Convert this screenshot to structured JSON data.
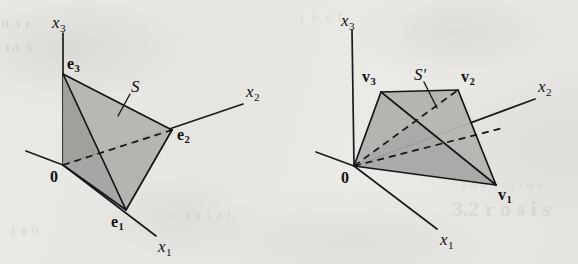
{
  "figure": {
    "background_color": "#e9e8e4",
    "ink_color": "#151515",
    "fill_light": "#b5b4b1",
    "fill_mid": "#a8a7a4",
    "fill_dark": "#9d9c99"
  },
  "ghost_text": {
    "left_top": "0 3 r",
    "left_mid": "to v",
    "left_bottom": "1 0 0",
    "center_bottom": "r a 1 a f",
    "right_heading": "3.2  r  o  s  i  s",
    "right_sub": "s o d u c t i o n",
    "top_right": "c o n t"
  },
  "panels": [
    {
      "id": "left",
      "name": "standard-simplex-panel",
      "set_label": "S",
      "set_label_position": {
        "x": 131,
        "y": 78
      },
      "leader": {
        "x1": 130,
        "y1": 94,
        "x2": 118,
        "y2": 116
      },
      "origin_label": "0",
      "origin_label_position": {
        "x": 50,
        "y": 169
      },
      "origin_point": {
        "x": 63,
        "y": 165
      },
      "axes": [
        {
          "name": "x3",
          "label": "x",
          "subscript": "3",
          "tip": {
            "x": 63,
            "y": 33
          },
          "label_position": {
            "x": 52,
            "y": 14
          }
        },
        {
          "name": "x2",
          "label": "x",
          "subscript": "2",
          "tip": {
            "x": 243,
            "y": 104
          },
          "label_position": {
            "x": 246,
            "y": 83
          }
        },
        {
          "name": "x1",
          "label": "x",
          "subscript": "1",
          "tip": {
            "x": 156,
            "y": 236
          },
          "label_position": {
            "x": 158,
            "y": 238
          }
        },
        {
          "name": "x2-negative",
          "label": "",
          "subscript": "",
          "tip": {
            "x": 26,
            "y": 151
          },
          "label_position": null
        }
      ],
      "vertices": [
        {
          "name": "e3",
          "label": "e",
          "subscript": "3",
          "point": {
            "x": 63,
            "y": 74
          },
          "label_position": {
            "x": 67,
            "y": 56
          }
        },
        {
          "name": "e2",
          "label": "e",
          "subscript": "2",
          "point": {
            "x": 172,
            "y": 130
          },
          "label_position": {
            "x": 177,
            "y": 127
          }
        },
        {
          "name": "e1",
          "label": "e",
          "subscript": "1",
          "point": {
            "x": 126,
            "y": 210
          },
          "label_position": {
            "x": 111,
            "y": 214
          }
        }
      ]
    },
    {
      "id": "right",
      "name": "transformed-simplex-panel",
      "set_label": "S",
      "set_label_prime": "′",
      "set_label_position": {
        "x": 414,
        "y": 66
      },
      "leader": {
        "x1": 424,
        "y1": 82,
        "x2": 437,
        "y2": 108
      },
      "origin_label": "0",
      "origin_label_position": {
        "x": 341,
        "y": 170
      },
      "origin_point": {
        "x": 354,
        "y": 166
      },
      "axes": [
        {
          "name": "x3",
          "label": "x",
          "subscript": "3",
          "tip": {
            "x": 352,
            "y": 30
          },
          "label_position": {
            "x": 341,
            "y": 12
          }
        },
        {
          "name": "x2",
          "label": "x",
          "subscript": "2",
          "tip": {
            "x": 535,
            "y": 99
          },
          "label_position": {
            "x": 538,
            "y": 78
          }
        },
        {
          "name": "x1",
          "label": "x",
          "subscript": "1",
          "tip": {
            "x": 437,
            "y": 229
          },
          "label_position": {
            "x": 440,
            "y": 231
          }
        },
        {
          "name": "x2-negative",
          "label": "",
          "subscript": "",
          "tip": {
            "x": 316,
            "y": 152
          },
          "label_position": null
        }
      ],
      "vertices": [
        {
          "name": "v3",
          "label": "v",
          "subscript": "3",
          "point": {
            "x": 381,
            "y": 92
          },
          "label_position": {
            "x": 362,
            "y": 69
          }
        },
        {
          "name": "v2",
          "label": "v",
          "subscript": "2",
          "point": {
            "x": 458,
            "y": 90
          },
          "label_position": {
            "x": 461,
            "y": 69
          }
        },
        {
          "name": "v1",
          "label": "v",
          "subscript": "1",
          "point": {
            "x": 496,
            "y": 185
          },
          "label_position": {
            "x": 498,
            "y": 187
          }
        }
      ]
    }
  ]
}
